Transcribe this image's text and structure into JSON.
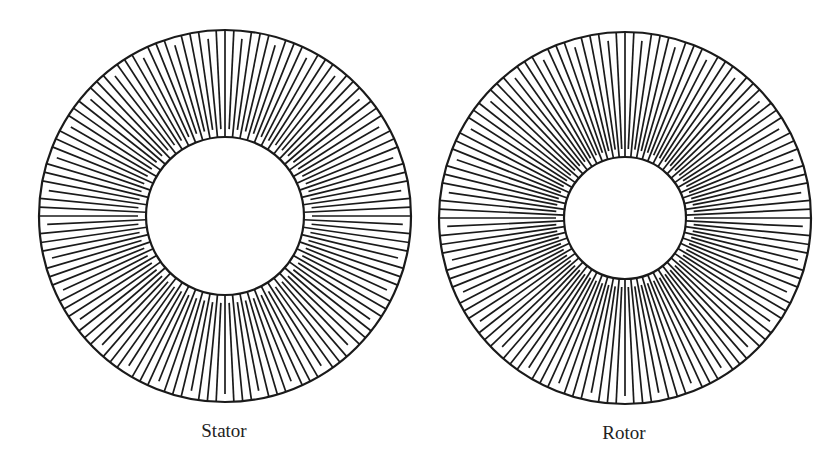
{
  "figure": {
    "stator": {
      "label": "Stator",
      "cx": 225,
      "cy": 216,
      "r_outer": 186,
      "r_inner": 79,
      "lines": 132,
      "group": 4,
      "gap": 8,
      "caption_x": 224,
      "caption_y": 420
    },
    "rotor": {
      "label": "Rotor",
      "cx": 625,
      "cy": 218,
      "r_outer": 186,
      "r_inner": 61,
      "lines": 132,
      "group": 4,
      "gap": 8,
      "caption_x": 624,
      "caption_y": 422
    },
    "stroke_color": "#1a1a1a"
  }
}
